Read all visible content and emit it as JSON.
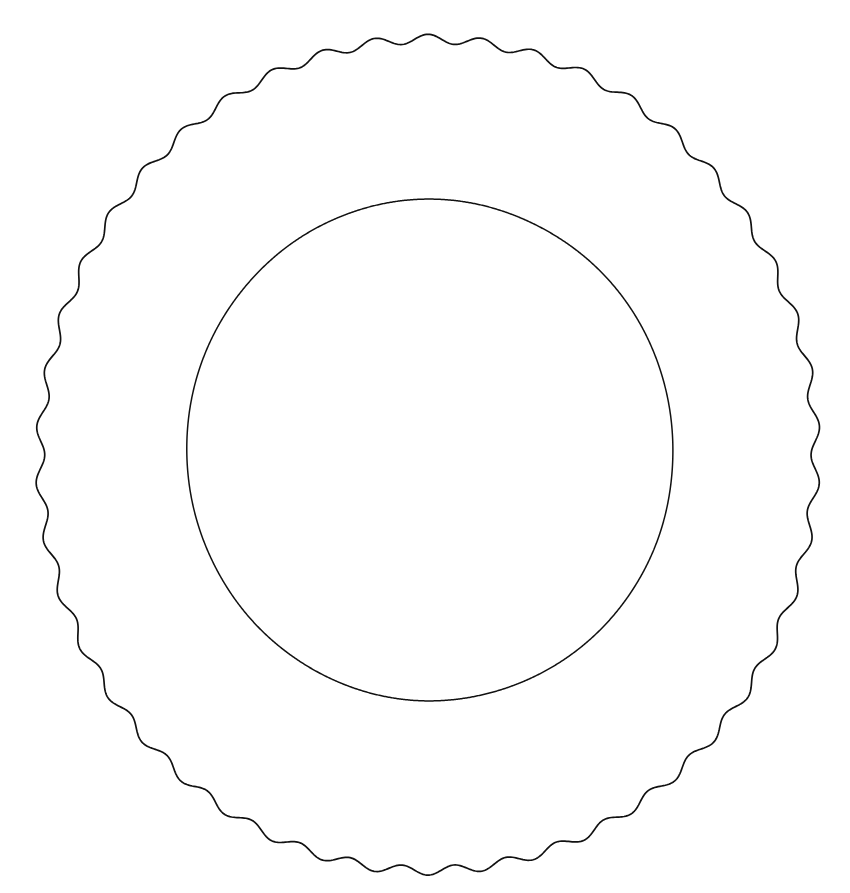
{
  "document": {
    "title": "Plate Line Drawing",
    "kind": "line-art-illustration",
    "subject": "plate",
    "description": "Black outline drawing of a round plate with a scalloped fluted rim and a plain circular inner well",
    "canvas": {
      "width": 850,
      "height": 893,
      "background_color": "#ffffff"
    }
  },
  "style": {
    "stroke_color": "#111111",
    "fill_color": "none",
    "outer_stroke_width": 1.7,
    "inner_stroke_width": 1.5,
    "hand_drawn": true
  },
  "shapes": {
    "outer_rim": {
      "label": "Scalloped outer rim",
      "type": "wavy-circle",
      "center_x": 428,
      "center_y": 455,
      "radius_x": 387,
      "radius_y": 416,
      "scallop_count": 46,
      "scallop_amplitude": 4.6,
      "wobble_amplitude": 1.6,
      "bounds": {
        "left": 41,
        "top": 39,
        "right": 815,
        "bottom": 871
      }
    },
    "inner_well": {
      "label": "Inner well circle",
      "type": "circle",
      "center_x": 430,
      "center_y": 450,
      "radius_x": 243,
      "radius_y": 251,
      "scallop_count": 0,
      "scallop_amplitude": 0,
      "wobble_amplitude": 1.1,
      "bounds": {
        "left": 187,
        "top": 199,
        "right": 673,
        "bottom": 701
      }
    }
  },
  "chart_data": {
    "type": "line",
    "xlabel": "",
    "ylabel": "",
    "series": [
      {
        "name": "outer_rim",
        "center": [
          428,
          455
        ],
        "radius": [
          387,
          416
        ],
        "modulation_periods": 46,
        "modulation_amplitude": 4.6
      },
      {
        "name": "inner_well",
        "center": [
          430,
          450
        ],
        "radius": [
          243,
          251
        ],
        "modulation_periods": 0,
        "modulation_amplitude": 0
      }
    ]
  }
}
